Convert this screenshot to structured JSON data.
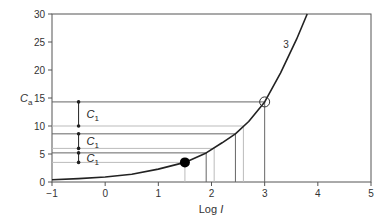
{
  "chart_data": {
    "type": "line",
    "title": "",
    "xlabel": "Log I",
    "ylabel": "C_a",
    "xlim": [
      -1,
      5
    ],
    "ylim": [
      0,
      30
    ],
    "xticks": [
      -1,
      0,
      1,
      2,
      3,
      4,
      5
    ],
    "yticks": [
      0,
      5,
      10,
      15,
      20,
      25,
      30
    ],
    "grid": false,
    "series": [
      {
        "name": "3",
        "x": [
          -1,
          -0.5,
          0,
          0.5,
          1,
          1.5,
          1.9,
          2.2,
          2.45,
          2.7,
          3,
          3.3,
          3.6,
          3.8
        ],
        "y": [
          0.4,
          0.6,
          0.9,
          1.4,
          2.3,
          3.5,
          5.2,
          7.0,
          8.6,
          10.8,
          14.3,
          19.5,
          25.5,
          30
        ]
      }
    ],
    "markers": [
      {
        "type": "filled-circle",
        "x": 1.5,
        "y": 3.5
      },
      {
        "type": "open-circle",
        "x": 3.0,
        "y": 14.3
      }
    ],
    "reference_lines": {
      "horizontal": [
        {
          "y": 14.3,
          "x_end": 3.0,
          "shade": "dark"
        },
        {
          "y": 10.0,
          "x_end": 2.6,
          "shade": "light"
        },
        {
          "y": 8.6,
          "x_end": 2.45,
          "shade": "dark"
        },
        {
          "y": 6.0,
          "x_end": 2.05,
          "shade": "light"
        },
        {
          "y": 5.2,
          "x_end": 1.9,
          "shade": "dark"
        },
        {
          "y": 3.5,
          "x_end": 1.5,
          "shade": "light"
        }
      ],
      "vertical": [
        {
          "x": 1.5,
          "y_top": 3.5,
          "shade": "light"
        },
        {
          "x": 1.9,
          "y_top": 5.2,
          "shade": "dark"
        },
        {
          "x": 2.05,
          "y_top": 6.0,
          "shade": "light"
        },
        {
          "x": 2.45,
          "y_top": 8.6,
          "shade": "dark"
        },
        {
          "x": 2.6,
          "y_top": 10.0,
          "shade": "light"
        },
        {
          "x": 3.0,
          "y_top": 14.3,
          "shade": "dark"
        }
      ]
    },
    "intervals": [
      {
        "label": "C1",
        "x": -0.5,
        "y_from": 10.0,
        "y_to": 14.3
      },
      {
        "label": "C1",
        "x": -0.5,
        "y_from": 6.0,
        "y_to": 8.6
      },
      {
        "label": "C1",
        "x": -0.5,
        "y_from": 3.5,
        "y_to": 5.2
      }
    ],
    "annotations": [
      {
        "text": "3",
        "x": 3.35,
        "y": 24
      }
    ]
  },
  "labels": {
    "xlabel_main": "Log ",
    "xlabel_var": "I",
    "ylabel_main": "C",
    "ylabel_sub": "a",
    "interval_main": "C",
    "interval_sub": "1",
    "curve_label": "3"
  }
}
